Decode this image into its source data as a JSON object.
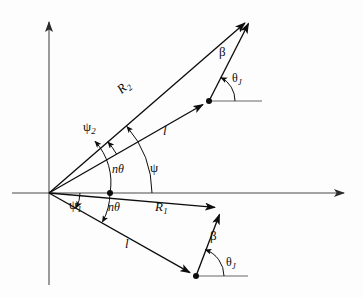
{
  "figure": {
    "background_color": "#fdfdfd",
    "line_color": "#0d0d0d",
    "axis_color": "#555555"
  },
  "axes": {
    "origin": {
      "x": 49,
      "y": 193
    },
    "horizontal": {
      "x1": 12,
      "y1": 193,
      "x2": 352,
      "y2": 193,
      "arrow": "right"
    },
    "vertical": {
      "x1": 49,
      "y1": 285,
      "x2": 49,
      "y2": 13,
      "arrow": "up"
    }
  },
  "vectors": {
    "upper": {
      "R2": {
        "label": "R",
        "subscript": "2",
        "from": {
          "x": 49,
          "y": 193
        },
        "to": {
          "x": 252,
          "y": 17
        }
      },
      "l": {
        "label": "l",
        "from": {
          "x": 49,
          "y": 193
        },
        "to": {
          "x": 209,
          "y": 101
        }
      },
      "beta": {
        "label": "β",
        "from": {
          "x": 209,
          "y": 101
        },
        "to": {
          "x": 252,
          "y": 17
        }
      },
      "reference_line": {
        "x1": 209,
        "y1": 101,
        "x2": 262,
        "y2": 101
      }
    },
    "lower": {
      "R1": {
        "label": "R",
        "subscript": "1",
        "from": {
          "x": 49,
          "y": 193
        },
        "to": {
          "x": 222,
          "y": 208
        }
      },
      "l": {
        "label": "l",
        "from": {
          "x": 49,
          "y": 193
        },
        "to": {
          "x": 196,
          "y": 276
        }
      },
      "beta": {
        "label": "β",
        "from": {
          "x": 196,
          "y": 276
        },
        "to": {
          "x": 222,
          "y": 208
        }
      },
      "reference_line": {
        "x1": 196,
        "y1": 276,
        "x2": 248,
        "y2": 276
      }
    },
    "psi2_ray": {
      "from": {
        "x": 49,
        "y": 193
      },
      "to": {
        "x": 252,
        "y": 17
      }
    }
  },
  "labels": {
    "R2": {
      "text": "R",
      "subscript": "2",
      "x": 124,
      "y": 88
    },
    "R1": {
      "text": "R",
      "subscript": "1",
      "x": 158,
      "y": 206
    },
    "l_upper": {
      "text": "l",
      "x": 163,
      "y": 130
    },
    "l_lower": {
      "text": "l",
      "x": 125,
      "y": 243
    },
    "beta_upper": {
      "text": "β",
      "x": 222,
      "y": 52
    },
    "beta_lower": {
      "text": "β",
      "x": 212,
      "y": 236
    },
    "theta_J_upper": {
      "text": "θ",
      "subscript": "J",
      "x": 234,
      "y": 79
    },
    "theta_J_lower": {
      "text": "θ",
      "subscript": "J",
      "x": 228,
      "y": 263
    },
    "psi": {
      "text": "ψ",
      "x": 152,
      "y": 168
    },
    "psi_1": {
      "text": "ψ",
      "subscript": "1",
      "x": 71,
      "y": 205
    },
    "psi_2": {
      "text": "ψ",
      "subscript": "2",
      "x": 85,
      "y": 127
    },
    "n_theta_upper": {
      "text": "nθ",
      "x": 116,
      "y": 170
    },
    "n_theta_lower": {
      "text": "nθ",
      "x": 112,
      "y": 208
    }
  },
  "arcs": {
    "psi": {
      "center": {
        "x": 49,
        "y": 193
      },
      "radius": 103,
      "from_deg": 0,
      "to_deg": 30
    },
    "n_theta_upper": {
      "center": {
        "x": 49,
        "y": 193
      },
      "radius": 61,
      "from_deg": 0,
      "to_deg": 41
    },
    "n_theta_lower": {
      "center": {
        "x": 49,
        "y": 193
      },
      "radius": 61,
      "from_deg": 0,
      "to_deg": -29
    },
    "psi_1": {
      "center": {
        "x": 49,
        "y": 193
      },
      "radius": 31,
      "from_deg": 0,
      "to_deg": -29
    },
    "psi_2": {
      "center": {
        "x": 49,
        "y": 193
      },
      "radius": 78,
      "from_deg": 30,
      "to_deg": 41
    },
    "theta_J_upper": {
      "center": {
        "x": 209,
        "y": 101
      },
      "radius": 26
    },
    "theta_J_lower": {
      "center": {
        "x": 196,
        "y": 276
      },
      "radius": 28
    }
  },
  "joint_dots": [
    {
      "x": 110,
      "y": 193,
      "r": 3
    },
    {
      "x": 209,
      "y": 101,
      "r": 3
    },
    {
      "x": 196,
      "y": 276,
      "r": 3
    }
  ]
}
